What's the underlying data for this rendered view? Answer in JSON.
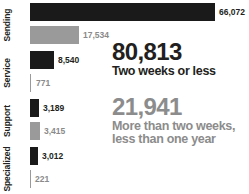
{
  "chart_data": {
    "type": "bar",
    "orientation": "horizontal",
    "title": "",
    "xlabel": "",
    "ylabel": "",
    "grid": false,
    "legend_position": "none",
    "xlim": [
      0,
      66072
    ],
    "categories": [
      "Sending",
      "Service",
      "Support",
      "Specialized"
    ],
    "series": [
      {
        "name": "Two weeks or less",
        "color": "#1a1a1a",
        "values": [
          66072,
          8540,
          3189,
          3012
        ],
        "labels": [
          "66,072",
          "8,540",
          "3,189",
          "3,012"
        ]
      },
      {
        "name": "More than two weeks, less than one year",
        "color": "#9a9a9a",
        "values": [
          17534,
          771,
          3415,
          221
        ],
        "labels": [
          "17,534",
          "771",
          "3,415",
          "221"
        ]
      }
    ]
  },
  "summary": {
    "blocks": [
      {
        "number": "80,813",
        "caption_lines": [
          "Two weeks or less"
        ],
        "color": "#231f20"
      },
      {
        "number": "21,941",
        "caption_lines": [
          "More than two weeks,",
          "less than one year"
        ],
        "color": "#8c8c8c"
      }
    ]
  },
  "colors": {
    "dark": "#1a1a1a",
    "light": "#9a9a9a",
    "text_dark": "#231f20",
    "text_light": "#8c8c8c",
    "background": "#ffffff"
  }
}
